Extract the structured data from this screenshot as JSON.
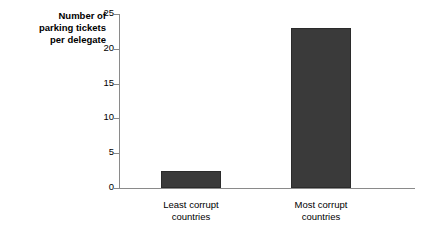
{
  "chart_data": {
    "type": "bar",
    "title": "",
    "ylabel": "Number of parking tickets per delegate",
    "ylabel_lines": [
      "Number of",
      "parking tickets",
      "per delegate"
    ],
    "xlabel": "",
    "categories": [
      "Least corrupt countries",
      "Most corrupt countries"
    ],
    "category_lines": [
      [
        "Least corrupt",
        "countries"
      ],
      [
        "Most corrupt",
        "countries"
      ]
    ],
    "values": [
      2.4,
      23
    ],
    "ylim": [
      0,
      25
    ],
    "yticks": [
      25,
      20,
      15,
      10,
      5,
      0
    ],
    "ytick_labels": [
      "25",
      "20",
      "15",
      "10",
      "5",
      "0"
    ],
    "grid": false,
    "legend": false,
    "bar_color": "#3a3a3a",
    "axis_color": "#8a8a8a",
    "background_color": "#ffffff"
  }
}
